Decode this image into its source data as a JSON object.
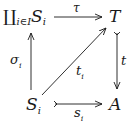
{
  "diagram": {
    "type": "commutative-diagram",
    "nodes": {
      "top_left": {
        "symbol": "∐",
        "index": "i∈I",
        "base": "S",
        "sub": "i"
      },
      "top_right": {
        "label": "T"
      },
      "bottom_left": {
        "base": "S",
        "sub": "i"
      },
      "bottom_right": {
        "label": "A"
      }
    },
    "arrows": {
      "top": {
        "label": "τ",
        "from": "∐_{i∈I} S_i",
        "to": "T"
      },
      "left": {
        "base": "σ",
        "sub": "i",
        "from": "S_i",
        "to": "∐_{i∈I} S_i"
      },
      "right": {
        "label": "t",
        "from": "T",
        "to": "A",
        "style": "mono"
      },
      "bottom": {
        "base": "s",
        "sub": "i",
        "from": "S_i",
        "to": "A",
        "style": "mono"
      },
      "diagonal": {
        "base": "t",
        "sub": "i",
        "from": "S_i",
        "to": "T"
      }
    },
    "stroke_color": "#1a1a1a"
  }
}
